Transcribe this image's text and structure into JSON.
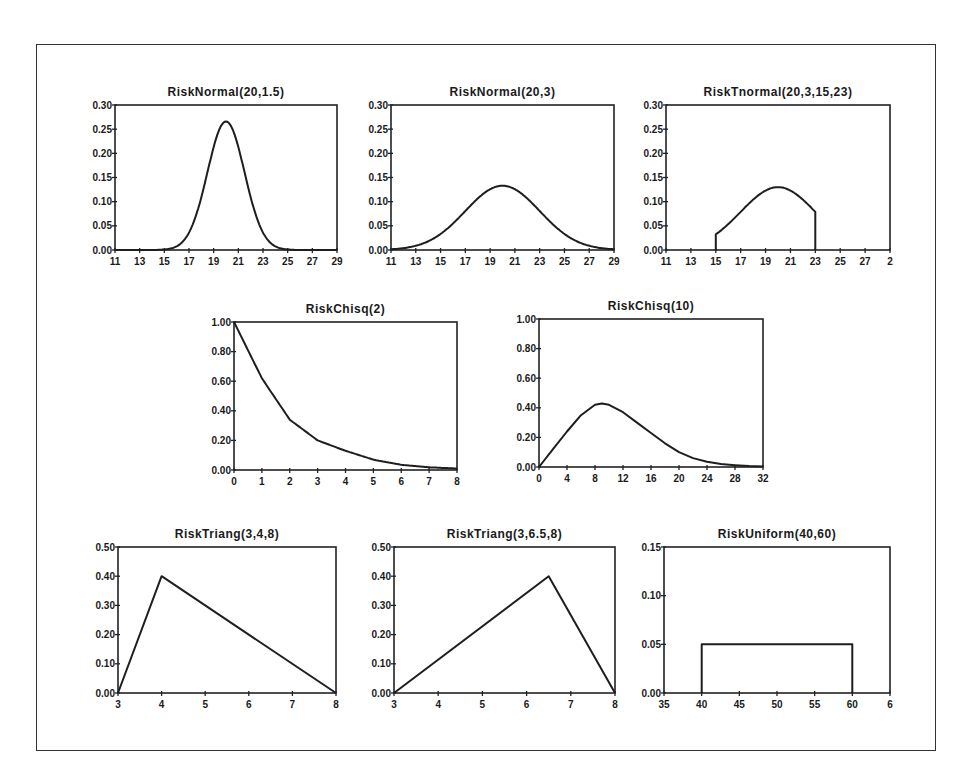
{
  "chart_data": [
    {
      "id": "normal-20-1.5",
      "type": "line",
      "title": "RiskNormal(20,1.5)",
      "xlabel": "",
      "ylabel": "",
      "box": [
        115,
        105,
        337,
        250
      ],
      "xlim": [
        11,
        29
      ],
      "ylim": [
        0,
        0.3
      ],
      "xticks": [
        11,
        13,
        15,
        17,
        19,
        21,
        23,
        25,
        27,
        29
      ],
      "xtick_labels": [
        "11",
        "13",
        "15",
        "17",
        "19",
        "21",
        "23",
        "25",
        "27",
        "29"
      ],
      "yticks": [
        0,
        0.05,
        0.1,
        0.15,
        0.2,
        0.25,
        0.3
      ],
      "ytick_labels": [
        "0.00",
        "0.05",
        "0.10",
        "0.15",
        "0.20",
        "0.25",
        "0.30"
      ],
      "dist": {
        "kind": "normal",
        "mean": 20,
        "sd": 1.5
      },
      "grid": false,
      "legend": null
    },
    {
      "id": "normal-20-3",
      "type": "line",
      "title": "RiskNormal(20,3)",
      "xlabel": "",
      "ylabel": "",
      "box": [
        391,
        105,
        614,
        250
      ],
      "xlim": [
        11,
        29
      ],
      "ylim": [
        0,
        0.3
      ],
      "xticks": [
        11,
        13,
        15,
        17,
        19,
        21,
        23,
        25,
        27,
        29
      ],
      "xtick_labels": [
        "11",
        "13",
        "15",
        "17",
        "19",
        "21",
        "23",
        "25",
        "27",
        "29"
      ],
      "yticks": [
        0,
        0.05,
        0.1,
        0.15,
        0.2,
        0.25,
        0.3
      ],
      "ytick_labels": [
        "0.00",
        "0.05",
        "0.10",
        "0.15",
        "0.20",
        "0.25",
        "0.30"
      ],
      "dist": {
        "kind": "normal",
        "mean": 20,
        "sd": 3
      },
      "grid": false,
      "legend": null
    },
    {
      "id": "tnormal-20-3-15-23",
      "type": "line",
      "title": "RiskTnormal(20,3,15,23)",
      "xlabel": "",
      "ylabel": "",
      "box": [
        666,
        105,
        890,
        250
      ],
      "xlim": [
        11,
        29
      ],
      "ylim": [
        0,
        0.3
      ],
      "xticks": [
        11,
        13,
        15,
        17,
        19,
        21,
        23,
        25,
        27,
        29
      ],
      "xtick_labels": [
        "11",
        "13",
        "15",
        "17",
        "19",
        "21",
        "23",
        "25",
        "27",
        "2"
      ],
      "yticks": [
        0,
        0.05,
        0.1,
        0.15,
        0.2,
        0.25,
        0.3
      ],
      "ytick_labels": [
        "0.00",
        "0.05",
        "0.10",
        "0.15",
        "0.20",
        "0.25",
        "0.30"
      ],
      "dist": {
        "kind": "tnormal",
        "mean": 20,
        "sd": 3,
        "min": 15,
        "max": 23,
        "peak": 0.13
      },
      "grid": false,
      "legend": null
    },
    {
      "id": "chisq-2",
      "type": "line",
      "title": "RiskChisq(2)",
      "xlabel": "",
      "ylabel": "",
      "box": [
        234,
        322,
        457,
        470
      ],
      "xlim": [
        0,
        8
      ],
      "ylim": [
        0,
        1.0
      ],
      "xticks": [
        0,
        1,
        2,
        3,
        4,
        5,
        6,
        7,
        8
      ],
      "xtick_labels": [
        "0",
        "1",
        "2",
        "3",
        "4",
        "5",
        "6",
        "7",
        "8"
      ],
      "yticks": [
        0,
        0.2,
        0.4,
        0.6,
        0.8,
        1.0
      ],
      "ytick_labels": [
        "0.00",
        "0.20",
        "0.40",
        "0.60",
        "0.80",
        "1.00"
      ],
      "dist": {
        "kind": "exp-like",
        "scale_points": [
          [
            0,
            1.0
          ],
          [
            1,
            0.62
          ],
          [
            2,
            0.34
          ],
          [
            3,
            0.2
          ],
          [
            4,
            0.13
          ],
          [
            5,
            0.07
          ],
          [
            6,
            0.035
          ],
          [
            7,
            0.018
          ],
          [
            8,
            0.01
          ]
        ]
      },
      "grid": false,
      "legend": null
    },
    {
      "id": "chisq-10",
      "type": "line",
      "title": "RiskChisq(10)",
      "xlabel": "",
      "ylabel": "",
      "box": [
        539,
        319,
        763,
        467
      ],
      "xlim": [
        0,
        32
      ],
      "ylim": [
        0,
        1.0
      ],
      "xticks": [
        0,
        4,
        8,
        12,
        16,
        20,
        24,
        28,
        32
      ],
      "xtick_labels": [
        "0",
        "4",
        "8",
        "12",
        "16",
        "20",
        "24",
        "28",
        "32"
      ],
      "yticks": [
        0,
        0.2,
        0.4,
        0.6,
        0.8,
        1.0
      ],
      "ytick_labels": [
        "0.00",
        "0.20",
        "0.40",
        "0.60",
        "0.80",
        "1.00"
      ],
      "dist": {
        "kind": "points",
        "points": [
          [
            0,
            0.0
          ],
          [
            2,
            0.12
          ],
          [
            4,
            0.24
          ],
          [
            6,
            0.35
          ],
          [
            8,
            0.42
          ],
          [
            9,
            0.43
          ],
          [
            10,
            0.42
          ],
          [
            12,
            0.37
          ],
          [
            14,
            0.3
          ],
          [
            16,
            0.23
          ],
          [
            18,
            0.16
          ],
          [
            20,
            0.1
          ],
          [
            22,
            0.06
          ],
          [
            24,
            0.035
          ],
          [
            26,
            0.02
          ],
          [
            28,
            0.012
          ],
          [
            30,
            0.006
          ],
          [
            32,
            0.003
          ]
        ]
      },
      "grid": false,
      "legend": null
    },
    {
      "id": "triang-3-4-8",
      "type": "line",
      "title": "RiskTriang(3,4,8)",
      "xlabel": "",
      "ylabel": "",
      "box": [
        118,
        547,
        336,
        693
      ],
      "xlim": [
        3,
        8
      ],
      "ylim": [
        0,
        0.5
      ],
      "xticks": [
        3,
        4,
        5,
        6,
        7,
        8
      ],
      "xtick_labels": [
        "3",
        "4",
        "5",
        "6",
        "7",
        "8"
      ],
      "yticks": [
        0,
        0.1,
        0.2,
        0.3,
        0.4,
        0.5
      ],
      "ytick_labels": [
        "0.00",
        "0.10",
        "0.20",
        "0.30",
        "0.40",
        "0.50"
      ],
      "dist": {
        "kind": "points",
        "points": [
          [
            3,
            0
          ],
          [
            4,
            0.4
          ],
          [
            8,
            0
          ]
        ]
      },
      "grid": false,
      "legend": null
    },
    {
      "id": "triang-3-6.5-8",
      "type": "line",
      "title": "RiskTriang(3,6.5,8)",
      "xlabel": "",
      "ylabel": "",
      "box": [
        394,
        547,
        615,
        693
      ],
      "xlim": [
        3,
        8
      ],
      "ylim": [
        0,
        0.5
      ],
      "xticks": [
        3,
        4,
        5,
        6,
        7,
        8
      ],
      "xtick_labels": [
        "3",
        "4",
        "5",
        "6",
        "7",
        "8"
      ],
      "yticks": [
        0,
        0.1,
        0.2,
        0.3,
        0.4,
        0.5
      ],
      "ytick_labels": [
        "0.00",
        "0.10",
        "0.20",
        "0.30",
        "0.40",
        "0.50"
      ],
      "dist": {
        "kind": "points",
        "points": [
          [
            3,
            0
          ],
          [
            6.5,
            0.4
          ],
          [
            8,
            0
          ]
        ]
      },
      "grid": false,
      "legend": null
    },
    {
      "id": "uniform-40-60",
      "type": "line",
      "title": "RiskUniform(40,60)",
      "xlabel": "",
      "ylabel": "",
      "box": [
        664,
        547,
        890,
        693
      ],
      "xlim": [
        35,
        65
      ],
      "ylim": [
        0,
        0.15
      ],
      "xticks": [
        35,
        40,
        45,
        50,
        55,
        60,
        65
      ],
      "xtick_labels": [
        "35",
        "40",
        "45",
        "50",
        "55",
        "60",
        "6"
      ],
      "yticks": [
        0,
        0.05,
        0.1,
        0.15
      ],
      "ytick_labels": [
        "0.00",
        "0.05",
        "0.10",
        "0.15"
      ],
      "dist": {
        "kind": "points",
        "points": [
          [
            40,
            0
          ],
          [
            40,
            0.05
          ],
          [
            60,
            0.05
          ],
          [
            60,
            0
          ]
        ]
      },
      "grid": false,
      "legend": null
    }
  ]
}
